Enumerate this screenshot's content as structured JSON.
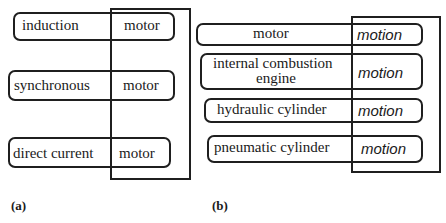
{
  "panel_a": {
    "label": "(a)",
    "rows": [
      {
        "prefix": "induction",
        "head": "motor"
      },
      {
        "prefix": "synchronous",
        "head": "motor"
      },
      {
        "prefix": "direct current",
        "head": "motor"
      }
    ]
  },
  "panel_b": {
    "label": "(b)",
    "rows": [
      {
        "prefix": "motor",
        "head": "motion"
      },
      {
        "prefix_line1": "internal combustion",
        "prefix_line2": "engine",
        "head": "motion"
      },
      {
        "prefix": "hydraulic cylinder",
        "head": "motion"
      },
      {
        "prefix": "pneumatic cylinder",
        "head": "motion"
      }
    ]
  }
}
